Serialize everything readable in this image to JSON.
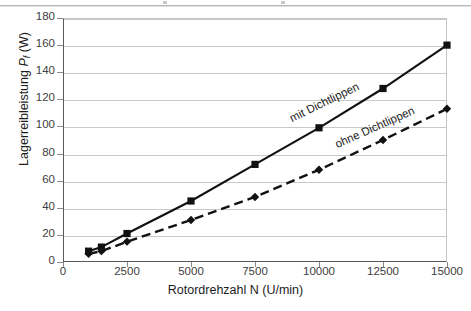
{
  "chart_data": {
    "type": "line",
    "title": "",
    "xlabel": "Rotordrehzahl N (U/min)",
    "ylabel": "Lagerreibleistung Pf (W)",
    "ylabel_main": "Lagerreibleistung ",
    "ylabel_symbol": "P",
    "ylabel_subscript": "f",
    "ylabel_unit": " (W)",
    "xlim": [
      0,
      15000
    ],
    "ylim": [
      0,
      180
    ],
    "xticks": [
      "0",
      "2500",
      "5000",
      "7500",
      "10000",
      "12500",
      "15000"
    ],
    "xtick_values": [
      0,
      2500,
      5000,
      7500,
      10000,
      12500,
      15000
    ],
    "yticks": [
      "0",
      "20",
      "40",
      "60",
      "80",
      "100",
      "120",
      "140",
      "160",
      "180"
    ],
    "ytick_values": [
      0,
      20,
      40,
      60,
      80,
      100,
      120,
      140,
      160,
      180
    ],
    "grid": "horizontal",
    "legend_position": "inline-labels",
    "series": [
      {
        "name": "mit Dichtlippen",
        "style": "solid",
        "marker": "square",
        "color": "#111111",
        "x": [
          1000,
          1500,
          2500,
          5000,
          7500,
          10000,
          12500,
          15000
        ],
        "values": [
          8,
          11,
          21,
          45,
          72,
          99,
          128,
          160
        ]
      },
      {
        "name": "ohne Dichtlippen",
        "style": "dashed",
        "marker": "diamond",
        "color": "#111111",
        "x": [
          1000,
          1500,
          2500,
          5000,
          7500,
          10000,
          12500,
          15000
        ],
        "values": [
          6,
          8,
          15,
          31,
          48,
          68,
          90,
          113
        ]
      }
    ]
  },
  "labels": {
    "series_mit": "mit Dichtlippen",
    "series_ohne": "ohne Dichtlippen"
  }
}
